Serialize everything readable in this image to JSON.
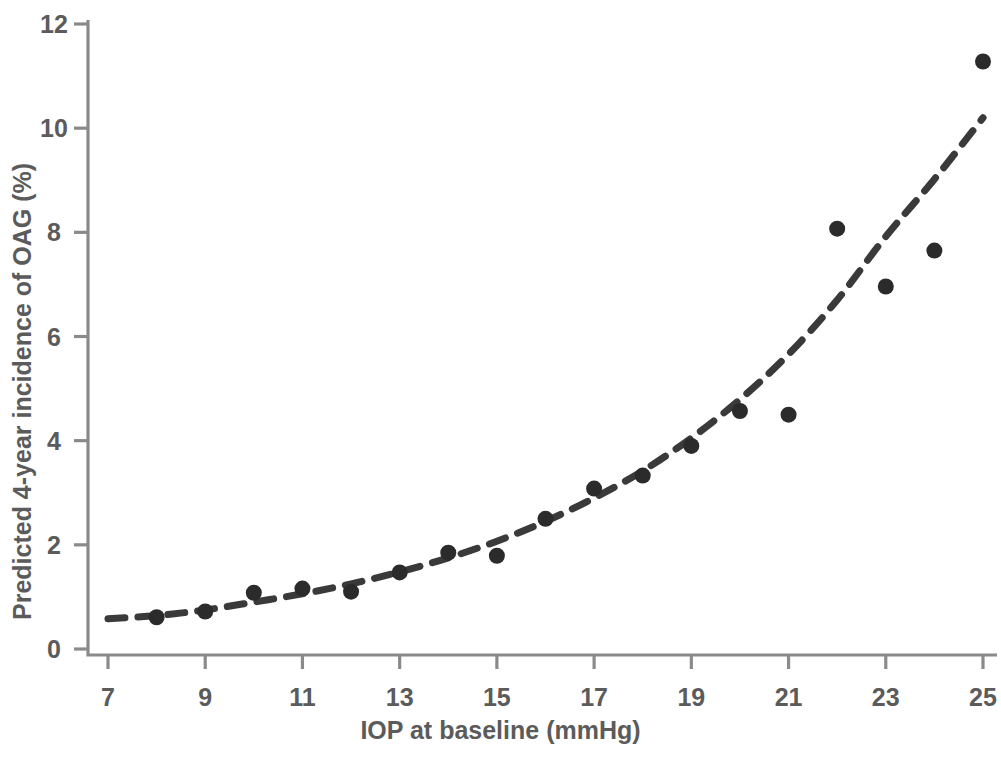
{
  "chart_data": {
    "type": "scatter",
    "title": "",
    "xlabel": "IOP at baseline (mmHg)",
    "ylabel": "Predicted 4-year incidence of OAG (%)",
    "xlim": [
      7,
      25
    ],
    "ylim": [
      0,
      12
    ],
    "xticks": [
      7,
      9,
      11,
      13,
      15,
      17,
      19,
      21,
      23,
      25
    ],
    "yticks": [
      0,
      2,
      4,
      6,
      8,
      10,
      12
    ],
    "xtick_labels": [
      "7",
      "9",
      "11",
      "13",
      "15",
      "17",
      "19",
      "21",
      "23",
      "25"
    ],
    "ytick_labels": [
      "0",
      "2",
      "4",
      "6",
      "8",
      "10",
      "12"
    ],
    "grid": false,
    "legend": "none",
    "marker_color": "#2b2b2b",
    "axis_color": "#8a8a8a",
    "curve_color": "#3a3a3a",
    "curve_style": "dashed",
    "series": [
      {
        "name": "Observed 4-year incidence of OAG",
        "type": "scatter",
        "x": [
          8,
          9,
          10,
          11,
          12,
          13,
          14,
          15,
          16,
          17,
          18,
          19,
          20,
          21,
          22,
          23,
          24,
          25
        ],
        "values": [
          0.61,
          0.72,
          1.08,
          1.16,
          1.1,
          1.47,
          1.85,
          1.79,
          2.5,
          3.08,
          3.33,
          3.9,
          4.57,
          4.5,
          8.07,
          6.96,
          7.65,
          11.28
        ]
      },
      {
        "name": "Fitted exponential model",
        "type": "line",
        "x": [
          7,
          8,
          9,
          10,
          11,
          12,
          13,
          14,
          15,
          16,
          17,
          18,
          19,
          20,
          21,
          22,
          23,
          24,
          25
        ],
        "values": [
          0.58,
          0.64,
          0.75,
          0.9,
          1.06,
          1.25,
          1.48,
          1.75,
          2.07,
          2.45,
          2.9,
          3.42,
          4.05,
          4.79,
          5.66,
          6.7,
          7.92,
          9.02,
          10.2
        ]
      }
    ]
  }
}
